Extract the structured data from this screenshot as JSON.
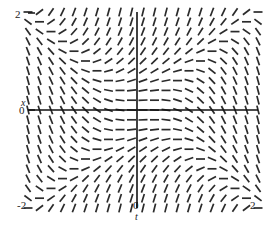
{
  "chart_data": {
    "type": "scatter",
    "plot_kind": "slope-field",
    "title": "",
    "subtitle": "",
    "xlabel": "t",
    "ylabel": "x",
    "xlim": [
      -2,
      2
    ],
    "ylim": [
      -2,
      2
    ],
    "grid": false,
    "legend": null,
    "axes": {
      "x_axis_at_y": 0,
      "y_axis_at_x": 0,
      "x_ticks": [
        -2,
        0,
        2
      ],
      "x_ticklabels": [
        "-2",
        "0",
        "2"
      ],
      "y_ticks": [
        0,
        2
      ],
      "y_ticklabels": [
        "0",
        "2"
      ]
    },
    "field": {
      "equation_form": "dx/dt = x^2 - t^2",
      "grid_columns": 21,
      "grid_rows": 21,
      "t_values": [
        -2,
        -1.8,
        -1.6,
        -1.4,
        -1.2,
        -1,
        -0.8,
        -0.6,
        -0.4,
        -0.2,
        0,
        0.2,
        0.4,
        0.6,
        0.8,
        1,
        1.2,
        1.4,
        1.6,
        1.8,
        2
      ],
      "x_values": [
        2,
        1.8,
        1.6,
        1.4,
        1.2,
        1,
        0.8,
        0.6,
        0.4,
        0.2,
        0,
        -0.2,
        -0.4,
        -0.6,
        -0.8,
        -1,
        -1.2,
        -1.4,
        -1.6,
        -1.8,
        -2
      ],
      "segment_length_px": 9,
      "stroke_color": "#2b2b2b",
      "stroke_width": 1.7
    },
    "annotations": []
  },
  "labels": {
    "y_max": "2",
    "y_zero": "0",
    "x_min": "-2",
    "x_zero": "0",
    "x_max": "2",
    "axis_x": "x",
    "axis_t": "t"
  },
  "colors": {
    "background": "#ffffff",
    "axis": "#111111",
    "tick": "#2b2b2b",
    "text": "#222222"
  }
}
